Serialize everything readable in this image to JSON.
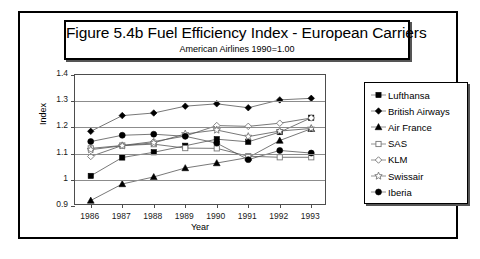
{
  "title": {
    "main": "Figure 5.4b  Fuel Efficiency Index - European Carriers",
    "sub": "American Airlines 1990=1.00"
  },
  "axes": {
    "y_title": "Index",
    "x_title": "Year",
    "y_ticks": [
      "1.4",
      "1.3",
      "1.2",
      "1.1",
      "1",
      "0.9"
    ],
    "x_ticks": [
      "1986",
      "1987",
      "1988",
      "1989",
      "1990",
      "1991",
      "1992",
      "1993"
    ]
  },
  "legend": {
    "items": [
      {
        "label": "Lufthansa",
        "marker": "filled-square-icon"
      },
      {
        "label": "British Airways",
        "marker": "filled-diamond-icon"
      },
      {
        "label": "Air France",
        "marker": "filled-triangle-icon"
      },
      {
        "label": "SAS",
        "marker": "open-square-icon"
      },
      {
        "label": "KLM",
        "marker": "open-diamond-icon"
      },
      {
        "label": "Swissair",
        "marker": "open-star-icon"
      },
      {
        "label": "Iberia",
        "marker": "filled-circle-icon"
      }
    ]
  },
  "chart_data": {
    "type": "line",
    "title": "Figure 5.4b  Fuel Efficiency Index - European Carriers",
    "subtitle": "American Airlines 1990=1.00",
    "xlabel": "Year",
    "ylabel": "Index",
    "x": [
      1986,
      1987,
      1988,
      1989,
      1990,
      1991,
      1992,
      1993
    ],
    "xlim": [
      1986,
      1993
    ],
    "ylim": [
      0.9,
      1.4
    ],
    "ytick_step": 0.1,
    "grid": "horizontal",
    "legend_position": "right",
    "series": [
      {
        "name": "Lufthansa",
        "marker": "filled-square",
        "values": [
          1.015,
          1.085,
          1.105,
          1.13,
          1.155,
          1.145,
          1.182,
          1.237
        ]
      },
      {
        "name": "British Airways",
        "marker": "filled-diamond",
        "values": [
          1.185,
          1.245,
          1.255,
          1.281,
          1.29,
          1.275,
          1.305,
          1.311
        ]
      },
      {
        "name": "Air France",
        "marker": "filled-triangle",
        "values": [
          0.921,
          0.984,
          1.011,
          1.045,
          1.064,
          1.085,
          1.15,
          1.195
        ]
      },
      {
        "name": "SAS",
        "marker": "open-square",
        "values": [
          1.12,
          1.131,
          1.136,
          1.121,
          1.12,
          1.09,
          1.086,
          1.086
        ]
      },
      {
        "name": "KLM",
        "marker": "open-diamond",
        "values": [
          1.089,
          1.131,
          1.146,
          1.167,
          1.207,
          1.204,
          1.216,
          1.236
        ]
      },
      {
        "name": "Swissair",
        "marker": "open-star",
        "values": [
          1.115,
          1.13,
          1.141,
          1.175,
          1.19,
          1.165,
          1.186,
          1.196
        ]
      },
      {
        "name": "Iberia",
        "marker": "filled-circle",
        "values": [
          1.146,
          1.17,
          1.174,
          1.166,
          1.14,
          1.077,
          1.112,
          1.102
        ]
      }
    ]
  }
}
